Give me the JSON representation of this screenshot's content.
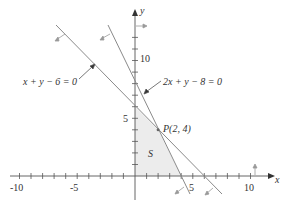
{
  "diagram": {
    "type": "linear-inequalities-feasible-region",
    "axes": {
      "x_label": "x",
      "y_label": "y",
      "x_tick_labels": [
        "-10",
        "-5",
        "5",
        "10"
      ],
      "y_tick_labels": [
        "5",
        "10"
      ],
      "x_range": [
        -10,
        10
      ],
      "y_range": [
        -2,
        13
      ]
    },
    "lines": [
      {
        "equation": "x + y − 6 = 0",
        "x_intercept": 6,
        "y_intercept": 6
      },
      {
        "equation": "2x + y − 8 = 0",
        "x_intercept": 4,
        "y_intercept": 8
      }
    ],
    "point": {
      "label": "P(2, 4)",
      "x": 2,
      "y": 4
    },
    "region": {
      "label": "S"
    },
    "colors": {
      "line": "#8a8a8a",
      "axis": "#555555",
      "region_fill": "#ececec",
      "text": "#333333"
    }
  }
}
